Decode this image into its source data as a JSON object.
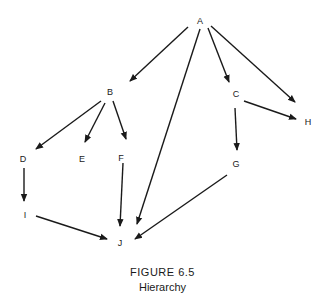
{
  "figure": {
    "title": "FIGURE 6.5",
    "subtitle": "Hierarchy"
  },
  "colors": {
    "line": "#1a1a1a",
    "background": "#ffffff"
  },
  "nodes": [
    {
      "id": "A",
      "label": "A",
      "x": 200,
      "y": 21
    },
    {
      "id": "B",
      "label": "B",
      "x": 110,
      "y": 92
    },
    {
      "id": "C",
      "label": "C",
      "x": 236,
      "y": 94
    },
    {
      "id": "H",
      "label": "H",
      "x": 308,
      "y": 122
    },
    {
      "id": "D",
      "label": "D",
      "x": 23,
      "y": 159
    },
    {
      "id": "E",
      "label": "E",
      "x": 82,
      "y": 159
    },
    {
      "id": "F",
      "label": "F",
      "x": 121,
      "y": 158
    },
    {
      "id": "G",
      "label": "G",
      "x": 236,
      "y": 164
    },
    {
      "id": "I",
      "label": "I",
      "x": 25,
      "y": 215
    },
    {
      "id": "J",
      "label": "J",
      "x": 120,
      "y": 243
    }
  ],
  "edges": [
    {
      "from": "A",
      "to": "B",
      "x1": 188,
      "y1": 27,
      "x2": 130,
      "y2": 81
    },
    {
      "from": "A",
      "to": "J",
      "x1": 200,
      "y1": 29,
      "x2": 137,
      "y2": 224
    },
    {
      "from": "A",
      "to": "C",
      "x1": 208,
      "y1": 28,
      "x2": 229,
      "y2": 82
    },
    {
      "from": "A",
      "to": "H",
      "x1": 211,
      "y1": 26,
      "x2": 295,
      "y2": 102
    },
    {
      "from": "B",
      "to": "D",
      "x1": 101,
      "y1": 101,
      "x2": 36,
      "y2": 149
    },
    {
      "from": "B",
      "to": "E",
      "x1": 105,
      "y1": 103,
      "x2": 85,
      "y2": 142
    },
    {
      "from": "B",
      "to": "F",
      "x1": 113,
      "y1": 101,
      "x2": 126,
      "y2": 139
    },
    {
      "from": "C",
      "to": "H",
      "x1": 244,
      "y1": 101,
      "x2": 296,
      "y2": 119
    },
    {
      "from": "C",
      "to": "G",
      "x1": 235,
      "y1": 108,
      "x2": 237,
      "y2": 150
    },
    {
      "from": "D",
      "to": "I",
      "x1": 24,
      "y1": 168,
      "x2": 24,
      "y2": 201
    },
    {
      "from": "F",
      "to": "J",
      "x1": 123,
      "y1": 163,
      "x2": 120,
      "y2": 226
    },
    {
      "from": "I",
      "to": "J",
      "x1": 36,
      "y1": 216,
      "x2": 107,
      "y2": 239
    },
    {
      "from": "G",
      "to": "J",
      "x1": 227,
      "y1": 175,
      "x2": 135,
      "y2": 239
    }
  ]
}
